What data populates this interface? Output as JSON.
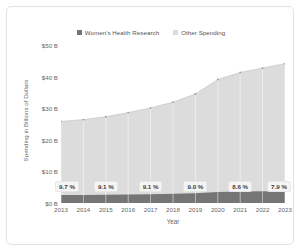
{
  "chart_data": {
    "type": "area",
    "title": "",
    "xlabel": "Year",
    "ylabel": "Spending in Billions of Dollars",
    "categories": [
      "2013",
      "2014",
      "2015",
      "2016",
      "2017",
      "2018",
      "2019",
      "2020",
      "2021",
      "2022",
      "2023"
    ],
    "x": [
      2013,
      2014,
      2015,
      2016,
      2017,
      2018,
      2019,
      2020,
      2021,
      2022,
      2023
    ],
    "ylim": [
      0,
      50
    ],
    "xlim": [
      2013,
      2023
    ],
    "y_ticks": [
      0,
      10,
      20,
      30,
      40,
      50
    ],
    "y_tick_labels": [
      "$0 B",
      "$10 B",
      "$20 B",
      "$30 B",
      "$40 B",
      "$50 B"
    ],
    "grid": false,
    "stacked": true,
    "legend_position": "top-center",
    "series": [
      {
        "name": "Women's Health Research",
        "color": "#757575",
        "values": [
          2.5,
          2.5,
          2.6,
          2.7,
          2.8,
          2.9,
          3.1,
          3.5,
          3.6,
          3.7,
          3.5
        ]
      },
      {
        "name": "Other Spending",
        "color": "#dcdcdc",
        "values": [
          23.3,
          23.9,
          24.7,
          25.9,
          27.3,
          29.0,
          31.4,
          35.6,
          37.7,
          39.0,
          40.6
        ]
      }
    ],
    "totals": [
      25.8,
      26.4,
      27.3,
      28.6,
      30.1,
      31.9,
      34.5,
      39.1,
      41.3,
      42.7,
      44.1
    ],
    "annotations": [
      {
        "x": "2013",
        "label": "9.7 %"
      },
      {
        "x": "2015",
        "label": "9.1 %"
      },
      {
        "x": "2017",
        "label": "9.1 %"
      },
      {
        "x": "2019",
        "label": "9.0 %"
      },
      {
        "x": "2021",
        "label": "8.6 %"
      },
      {
        "x": "2023",
        "label": "7.9 %"
      }
    ],
    "annotation_note": "Women's Health Research share of total spending"
  },
  "legend": {
    "items": [
      {
        "label": "Women's Health Research",
        "color": "#757575"
      },
      {
        "label": "Other Spending",
        "color": "#dcdcdc"
      }
    ]
  },
  "axes": {
    "y_title": "Spending in Billions of Dollars",
    "x_title": "Year"
  },
  "colors": {
    "card_background": "#ffffff",
    "card_border": "#e3e3e3",
    "series_primary": "#757575",
    "series_secondary": "#dcdcdc",
    "axis_text": "#666666",
    "badge_background": "#f5f5f5",
    "badge_border": "#e6e6e6"
  }
}
